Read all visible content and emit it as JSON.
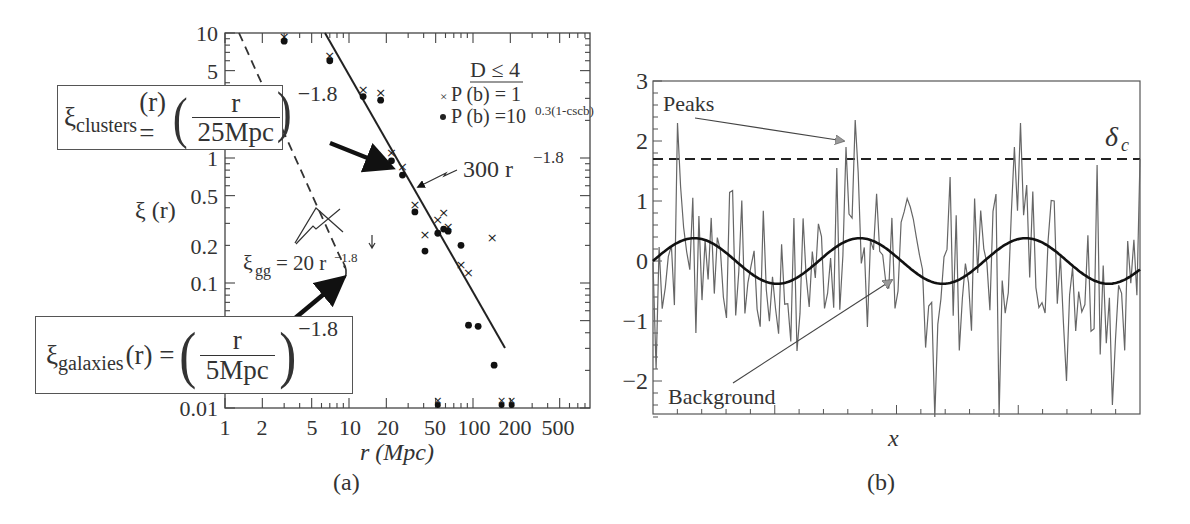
{
  "figure": {
    "panel_a": {
      "caption": "(a)",
      "ylabel": "ξ (r)",
      "xlabel": "r (Mpc)",
      "yticks": [
        "10",
        "5",
        "1",
        "0.5",
        "0.2",
        "0.1",
        "0.01"
      ],
      "xticks": [
        "1",
        "2",
        "5",
        "10",
        "20",
        "50",
        "100",
        "200",
        "500"
      ],
      "legend": {
        "title": "D ≤ 4",
        "cross_label": "P (b) = 1",
        "dot_label_base": "P (b) =10",
        "dot_label_exp": "0.3(1-cscb)"
      },
      "annotations": {
        "fit_line": "300 r",
        "fit_exp": "−1.8",
        "gg_label_xi": "ξ",
        "gg_label_sub": "gg",
        "gg_label_rest": "= 20 r",
        "gg_exp": "−1.8"
      },
      "eq_clusters": {
        "xi": "ξ",
        "sub": "clusters",
        "lhs_rest": "(r) =",
        "num": "r",
        "den": "25Mpc",
        "exp": "−1.8"
      },
      "eq_galaxies": {
        "xi": "ξ",
        "sub": "galaxies",
        "lhs_rest": "(r) =",
        "num": "r",
        "den": "5Mpc",
        "exp": "−1.8"
      }
    },
    "panel_b": {
      "caption": "(b)",
      "xlabel": "x",
      "yticks": [
        "3",
        "2",
        "1",
        "0",
        "−1",
        "−2"
      ],
      "threshold_label": "δ",
      "threshold_sub": "c",
      "peaks_label": "Peaks",
      "background_label": "Background"
    }
  },
  "chart_data": [
    {
      "type": "scatter",
      "title": "",
      "xlabel": "r (Mpc)",
      "ylabel": "ξ (r)",
      "xscale": "log",
      "yscale": "log",
      "xlim": [
        1,
        1000
      ],
      "ylim": [
        0.01,
        10
      ],
      "legend_title": "D ≤ 4",
      "series": [
        {
          "name": "P (b) = 1 (crosses)",
          "marker": "x",
          "points": [
            [
              3,
              9.3
            ],
            [
              7,
              6.6
            ],
            [
              13,
              3.5
            ],
            [
              18,
              3.3
            ],
            [
              22,
              1.1
            ],
            [
              27,
              0.85
            ],
            [
              34,
              0.42
            ],
            [
              41,
              0.24
            ],
            [
              52,
              0.32
            ],
            [
              58,
              0.36
            ],
            [
              63,
              0.28
            ],
            [
              80,
              0.14
            ],
            [
              92,
              0.12
            ],
            [
              143,
              0.23
            ]
          ]
        },
        {
          "name": "P (b) = 10^0.3(1-cscb) (dots)",
          "marker": "dot",
          "points": [
            [
              3,
              8.6
            ],
            [
              7,
              6.0
            ],
            [
              13,
              3.1
            ],
            [
              18,
              2.9
            ],
            [
              22,
              0.95
            ],
            [
              27,
              0.73
            ],
            [
              34,
              0.37
            ],
            [
              41,
              0.18
            ],
            [
              52,
              0.25
            ],
            [
              58,
              0.27
            ],
            [
              63,
              0.26
            ],
            [
              80,
              0.2
            ],
            [
              92,
              0.046
            ],
            [
              110,
              0.045
            ],
            [
              148,
              0.022
            ]
          ]
        }
      ],
      "lines": [
        {
          "name": "300 r^-1.8",
          "style": "solid",
          "x_range": [
            6.5,
            160
          ]
        },
        {
          "name": "ξ_gg = 20 r^-1.8",
          "style": "dashed",
          "x_range": [
            1.2,
            14
          ]
        }
      ],
      "annotations": [
        "ξ_clusters(r) = (r / 25Mpc)^-1.8",
        "ξ_galaxies(r) = (r / 5Mpc)^-1.8",
        "300 r^-1.8",
        "ξ_gg = 20 r^-1.8"
      ]
    },
    {
      "type": "line",
      "title": "",
      "xlabel": "x",
      "ylabel": "",
      "ylim": [
        -2.6,
        3
      ],
      "yticks": [
        -2,
        -1,
        0,
        1,
        2,
        3
      ],
      "series": [
        {
          "name": "Background (sinusoid)",
          "amplitude": 0.38,
          "periods": 3,
          "style": "thick solid"
        },
        {
          "name": "Noisy field",
          "style": "thin solid",
          "values_sample": [
            0.0,
            -1.8,
            0.7,
            -0.3,
            0.6,
            -0.1,
            2.3,
            -1.2,
            0.8,
            -0.9,
            0.2,
            -0.6,
            1.35,
            -1.1,
            0.1,
            -0.3,
            0.9,
            -0.8,
            0.9,
            -0.4,
            0.9,
            -1.45,
            1.55,
            0.6,
            1.1,
            0.7,
            1.9,
            0.8,
            2.35,
            -0.5
          ]
        },
        {
          "name": "δ_c threshold",
          "value": 1.68,
          "style": "dashed"
        }
      ],
      "annotations": [
        "Peaks",
        "Background",
        "δ_c"
      ]
    }
  ]
}
